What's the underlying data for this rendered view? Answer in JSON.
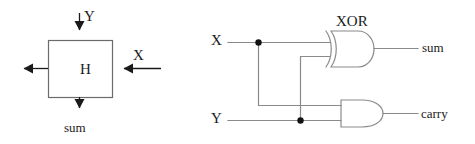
{
  "figure": {
    "stroke_color": "#4d4d4d",
    "text_color": "#1a1a1a",
    "background": "#ffffff"
  },
  "block_diagram": {
    "name": "half-adder-block-symbol",
    "box_label": "H",
    "ports": [
      {
        "id": "y-in",
        "label": "Y",
        "direction": "input",
        "side": "top"
      },
      {
        "id": "x-in",
        "label": "X",
        "direction": "input",
        "side": "right"
      },
      {
        "id": "carry-out",
        "label": "",
        "direction": "output",
        "side": "left"
      },
      {
        "id": "sum-out",
        "label": "sum",
        "direction": "output",
        "side": "bottom"
      }
    ]
  },
  "gate_diagram": {
    "name": "half-adder-gate-level",
    "inputs": [
      {
        "id": "x",
        "label": "X"
      },
      {
        "id": "y",
        "label": "Y"
      }
    ],
    "gates": [
      {
        "id": "xor1",
        "type": "XOR",
        "label": "XOR",
        "inputs": [
          "x",
          "y"
        ],
        "output": "sum"
      },
      {
        "id": "and1",
        "type": "AND",
        "label": "",
        "inputs": [
          "x",
          "y"
        ],
        "output": "carry"
      }
    ],
    "outputs": [
      {
        "id": "sum",
        "label": "sum"
      },
      {
        "id": "carry",
        "label": "carry"
      }
    ],
    "junctions": [
      {
        "id": "x-tap",
        "on": "x"
      },
      {
        "id": "y-tap",
        "on": "y"
      }
    ]
  }
}
